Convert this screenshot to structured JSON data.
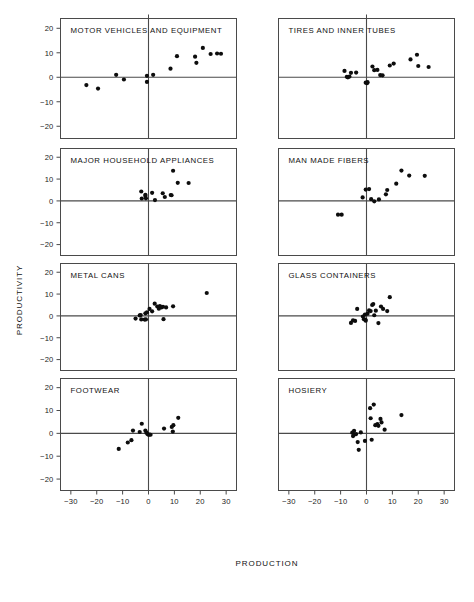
{
  "figure": {
    "xlabel": "PRODUCTION",
    "ylabel": "PRODUCTIVITY",
    "x_ticks": [
      -30,
      -20,
      -10,
      0,
      10,
      20,
      30
    ],
    "y_ticks": [
      20,
      10,
      0,
      -10,
      -20
    ],
    "x_tick_labels": [
      "−30",
      "−20",
      "−10",
      "0",
      "10",
      "20",
      "30"
    ],
    "y_tick_labels": [
      "20",
      "10",
      "0",
      "−10",
      "−20"
    ],
    "xlim": [
      -34,
      34
    ],
    "ylim": [
      -25,
      24
    ],
    "marker_color": "#0d0d0d",
    "axis_color": "#4a4a4a",
    "background": "#ffffff"
  },
  "chart_data": {
    "type": "scatter",
    "title": "",
    "xlabel": "PRODUCTION",
    "ylabel": "PRODUCTIVITY",
    "xlim": [
      -34,
      34
    ],
    "ylim": [
      -25,
      24
    ],
    "grid": false,
    "legend": "none",
    "layout": {
      "rows": 4,
      "cols": 2
    },
    "panels": [
      {
        "name": "MOTOR VEHICLES AND EQUIPMENT",
        "row": 1,
        "col": 1,
        "points": [
          [
            -24.0,
            -3.2
          ],
          [
            -19.5,
            -4.6
          ],
          [
            -12.5,
            1.0
          ],
          [
            -9.5,
            -0.9
          ],
          [
            -0.6,
            0.6
          ],
          [
            -0.6,
            -1.9
          ],
          [
            1.8,
            1.0
          ],
          [
            8.5,
            3.5
          ],
          [
            11.0,
            8.6
          ],
          [
            18.0,
            8.4
          ],
          [
            18.5,
            5.9
          ],
          [
            21.0,
            12.0
          ],
          [
            24.0,
            9.5
          ],
          [
            26.5,
            9.7
          ],
          [
            28.0,
            9.6
          ]
        ]
      },
      {
        "name": "TIRES AND INNER TUBES",
        "row": 1,
        "col": 2,
        "points": [
          [
            -8.5,
            2.6
          ],
          [
            -7.6,
            0.2
          ],
          [
            -7.2,
            0.0
          ],
          [
            -6.6,
            0.3
          ],
          [
            -6.0,
            1.8
          ],
          [
            -4.0,
            1.9
          ],
          [
            -0.3,
            -2.2
          ],
          [
            0.2,
            -2.4
          ],
          [
            0.4,
            -2.0
          ],
          [
            2.3,
            4.4
          ],
          [
            3.0,
            2.9
          ],
          [
            4.2,
            3.0
          ],
          [
            5.3,
            0.9
          ],
          [
            6.2,
            0.8
          ],
          [
            9.0,
            4.8
          ],
          [
            10.5,
            5.6
          ],
          [
            17.0,
            7.3
          ],
          [
            19.5,
            9.2
          ],
          [
            20.0,
            4.6
          ],
          [
            24.0,
            4.2
          ]
        ]
      },
      {
        "name": "MAJOR HOUSEHOLD APPLIANCES",
        "row": 2,
        "col": 1,
        "points": [
          [
            -2.8,
            4.3
          ],
          [
            -1.2,
            2.8
          ],
          [
            -1.2,
            2.3
          ],
          [
            -1.0,
            1.2
          ],
          [
            -2.6,
            1.1
          ],
          [
            1.4,
            3.7
          ],
          [
            2.5,
            0.4
          ],
          [
            5.5,
            3.5
          ],
          [
            6.3,
            1.8
          ],
          [
            8.6,
            2.7
          ],
          [
            8.9,
            2.6
          ],
          [
            9.5,
            13.8
          ],
          [
            11.3,
            8.3
          ],
          [
            15.5,
            8.2
          ]
        ]
      },
      {
        "name": "MAN MADE FIBERS",
        "row": 2,
        "col": 2,
        "points": [
          [
            -11.0,
            -6.3
          ],
          [
            -9.6,
            -6.3
          ],
          [
            -1.5,
            1.6
          ],
          [
            -0.3,
            5.2
          ],
          [
            1.0,
            5.4
          ],
          [
            1.8,
            0.8
          ],
          [
            3.0,
            -0.2
          ],
          [
            4.8,
            0.7
          ],
          [
            7.5,
            3.0
          ],
          [
            8.0,
            5.0
          ],
          [
            11.5,
            7.9
          ],
          [
            13.5,
            13.9
          ],
          [
            16.5,
            11.6
          ],
          [
            22.5,
            11.5
          ]
        ]
      },
      {
        "name": "METAL CANS",
        "row": 3,
        "col": 1,
        "points": [
          [
            -5.0,
            -1.2
          ],
          [
            -3.4,
            0.2
          ],
          [
            -3.0,
            0.4
          ],
          [
            -2.8,
            -1.6
          ],
          [
            -1.5,
            -1.7
          ],
          [
            -1.2,
            1.2
          ],
          [
            -1.0,
            -1.6
          ],
          [
            -0.6,
            1.6
          ],
          [
            0.4,
            3.2
          ],
          [
            1.4,
            2.1
          ],
          [
            2.4,
            5.6
          ],
          [
            3.4,
            4.3
          ],
          [
            4.0,
            3.3
          ],
          [
            4.4,
            4.5
          ],
          [
            5.0,
            3.9
          ],
          [
            5.6,
            4.2
          ],
          [
            5.8,
            -1.5
          ],
          [
            6.8,
            3.9
          ],
          [
            9.5,
            4.4
          ],
          [
            22.5,
            10.5
          ]
        ]
      },
      {
        "name": "GLASS CONTAINERS",
        "row": 3,
        "col": 2,
        "points": [
          [
            -6.0,
            -3.2
          ],
          [
            -5.2,
            -2.0
          ],
          [
            -4.4,
            -2.3
          ],
          [
            -3.6,
            3.2
          ],
          [
            -1.4,
            -0.3
          ],
          [
            -1.0,
            -1.5
          ],
          [
            -0.6,
            0.6
          ],
          [
            -0.4,
            -1.8
          ],
          [
            -0.3,
            -2.2
          ],
          [
            0.4,
            1.0
          ],
          [
            1.0,
            2.5
          ],
          [
            1.6,
            2.2
          ],
          [
            2.2,
            5.0
          ],
          [
            2.6,
            5.4
          ],
          [
            3.0,
            0.3
          ],
          [
            3.6,
            2.4
          ],
          [
            4.6,
            -3.3
          ],
          [
            5.6,
            4.3
          ],
          [
            6.4,
            3.2
          ],
          [
            8.0,
            2.2
          ],
          [
            9.0,
            8.6
          ]
        ]
      },
      {
        "name": "FOOTWEAR",
        "row": 4,
        "col": 1,
        "points": [
          [
            -11.5,
            -6.8
          ],
          [
            -8.0,
            -4.0
          ],
          [
            -6.6,
            -3.0
          ],
          [
            -6.0,
            1.2
          ],
          [
            -3.4,
            0.6
          ],
          [
            -2.6,
            4.2
          ],
          [
            -1.2,
            1.2
          ],
          [
            -0.8,
            0.3
          ],
          [
            -0.4,
            -0.3
          ],
          [
            0.0,
            -0.6
          ],
          [
            0.4,
            -0.5
          ],
          [
            0.8,
            -0.6
          ],
          [
            6.0,
            2.1
          ],
          [
            9.0,
            2.8
          ],
          [
            9.4,
            0.8
          ],
          [
            9.6,
            3.6
          ],
          [
            11.5,
            6.8
          ]
        ]
      },
      {
        "name": "HOSIERY",
        "row": 4,
        "col": 2,
        "points": [
          [
            -5.5,
            0.3
          ],
          [
            -5.2,
            -1.2
          ],
          [
            -4.8,
            1.1
          ],
          [
            -4.6,
            -0.5
          ],
          [
            -4.0,
            -0.3
          ],
          [
            -3.4,
            -3.8
          ],
          [
            -3.0,
            -7.2
          ],
          [
            -2.2,
            0.4
          ],
          [
            -0.6,
            -3.3
          ],
          [
            1.4,
            11.0
          ],
          [
            1.6,
            6.6
          ],
          [
            2.0,
            -2.8
          ],
          [
            2.8,
            12.6
          ],
          [
            3.4,
            3.6
          ],
          [
            4.2,
            4.0
          ],
          [
            4.6,
            3.3
          ],
          [
            5.4,
            6.3
          ],
          [
            5.8,
            4.8
          ],
          [
            7.0,
            1.6
          ],
          [
            13.5,
            8.0
          ]
        ]
      }
    ]
  }
}
